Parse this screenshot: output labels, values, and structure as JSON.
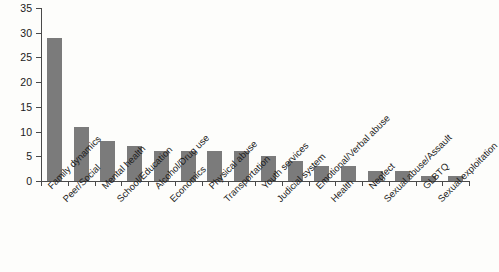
{
  "chart_data": {
    "type": "bar",
    "title": "",
    "subtitle": "",
    "xlabel": "",
    "ylabel": "",
    "ylim": [
      0,
      35
    ],
    "ytick_step": 5,
    "yticks": [
      0,
      5,
      10,
      15,
      20,
      25,
      30,
      35
    ],
    "grid": false,
    "legend": null,
    "orientation": "vertical",
    "bar_color": "#7b7b7b",
    "background_color": "#fdfdfb",
    "axis_color": "#4a4a4a",
    "categories": [
      "Family dynamics",
      "Peer/Social",
      "Mental health",
      "School/Education",
      "Alcohol/Drug use",
      "Economics",
      "Physical abuse",
      "Transportation",
      "Youth services",
      "Judicial system",
      "Emotional/Verbal abuse",
      "Health",
      "Neglect",
      "Sexual abuse/Assault",
      "GLBTQ",
      "Sexual exploitation"
    ],
    "values": [
      29,
      11,
      8,
      7,
      6,
      6,
      6,
      6,
      5,
      4,
      3,
      3,
      2,
      2,
      1,
      1
    ]
  }
}
